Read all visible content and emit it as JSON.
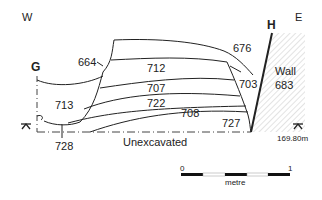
{
  "compass": {
    "west": "W",
    "east": "E"
  },
  "section_points": {
    "start": "G",
    "end": "H"
  },
  "contexts": [
    {
      "id": "664",
      "label": "664"
    },
    {
      "id": "712",
      "label": "712"
    },
    {
      "id": "676",
      "label": "676"
    },
    {
      "id": "703",
      "label": "703"
    },
    {
      "id": "713",
      "label": "713"
    },
    {
      "id": "707",
      "label": "707"
    },
    {
      "id": "722",
      "label": "722"
    },
    {
      "id": "708",
      "label": "708"
    },
    {
      "id": "727",
      "label": "727"
    },
    {
      "id": "728",
      "label": "728"
    }
  ],
  "wall": {
    "label_line1": "Wall",
    "label_line2": "683"
  },
  "base": {
    "label": "Unexcavated"
  },
  "datum": {
    "value": "169.80m"
  },
  "scale_bar": {
    "start": "0",
    "end": "1",
    "unit": "metre"
  },
  "colors": {
    "line": "#222222",
    "hatch": "#c8c8c8"
  }
}
